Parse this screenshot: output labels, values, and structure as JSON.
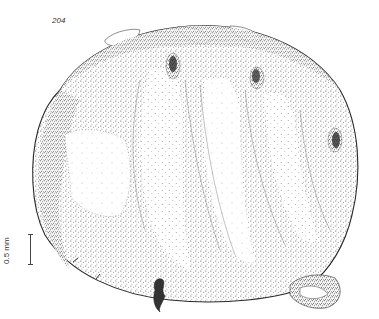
{
  "figure": {
    "number": "204"
  },
  "scale_bar": {
    "label": "0.5 mm"
  },
  "colors": {
    "background": "#ffffff",
    "ink": "#2a2a2a",
    "stipple_dark": "#3a3a3a",
    "stipple_light": "#8a8a8a"
  }
}
